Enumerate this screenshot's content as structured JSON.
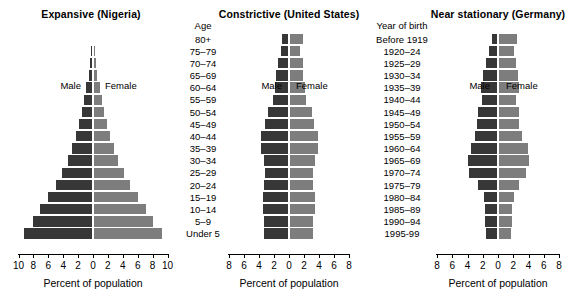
{
  "figure": {
    "axis_title": "Percent of population",
    "male_label": "Male",
    "female_label": "Female",
    "age_column_header": "Age",
    "year_column_header": "Year of birth"
  },
  "age_groups": [
    "80+",
    "75–79",
    "70–74",
    "65–69",
    "60–64",
    "55–59",
    "50–54",
    "45–49",
    "40–44",
    "35–39",
    "30–34",
    "25–29",
    "20–24",
    "15–19",
    "10–14",
    "5–9",
    "Under 5"
  ],
  "years_of_birth": [
    "Before 1919",
    "1920–24",
    "1925–29",
    "1930–34",
    "1935–39",
    "1940–44",
    "1945–49",
    "1950–54",
    "1955–59",
    "1960–64",
    "1965–69",
    "1970–74",
    "1975–79",
    "1980–84",
    "1985–89",
    "1990–94",
    "1995-99"
  ],
  "colors": {
    "male": "#373737",
    "female": "#7d7d7d",
    "background": "#ffffff",
    "axis": "#000000"
  },
  "chart_data": [
    {
      "type": "bar",
      "title": "Expansive (Nigeria)",
      "xlabel": "Percent of population",
      "ylabel": "Age",
      "xlim": [
        -10,
        10
      ],
      "xticks": [
        10,
        8,
        6,
        4,
        2,
        0,
        2,
        4,
        6,
        8,
        10
      ],
      "grid": false,
      "legend_position": "inside-plot",
      "categories": [
        "80+",
        "75–79",
        "70–74",
        "65–69",
        "60–64",
        "55–59",
        "50–54",
        "45–49",
        "40–44",
        "35–39",
        "30–34",
        "25–29",
        "20–24",
        "15–19",
        "10–14",
        "5–9",
        "Under 5"
      ],
      "series": [
        {
          "name": "Male",
          "values": [
            0.15,
            0.25,
            0.4,
            0.6,
            0.9,
            1.2,
            1.5,
            1.9,
            2.3,
            2.8,
            3.4,
            4.2,
            5.0,
            6.0,
            7.1,
            8.0,
            9.3
          ]
        },
        {
          "name": "Female",
          "values": [
            0.15,
            0.25,
            0.4,
            0.6,
            0.9,
            1.2,
            1.5,
            1.9,
            2.3,
            2.8,
            3.4,
            4.2,
            5.0,
            6.0,
            7.1,
            8.0,
            9.3
          ]
        }
      ]
    },
    {
      "type": "bar",
      "title": "Constrictive (United States)",
      "xlabel": "Percent of population",
      "ylabel": "Age",
      "xlim": [
        -8,
        8
      ],
      "xticks": [
        8,
        6,
        4,
        2,
        0,
        2,
        4,
        6,
        8
      ],
      "grid": false,
      "legend_position": "inside-plot",
      "categories": [
        "80+",
        "75–79",
        "70–74",
        "65–69",
        "60–64",
        "55–59",
        "50–54",
        "45–49",
        "40–44",
        "35–39",
        "30–34",
        "25–29",
        "20–24",
        "15–19",
        "10–14",
        "5–9",
        "Under 5"
      ],
      "series": [
        {
          "name": "Male",
          "values": [
            1.0,
            1.1,
            1.5,
            1.7,
            1.9,
            2.1,
            2.8,
            3.2,
            3.8,
            3.8,
            3.4,
            3.2,
            3.3,
            3.5,
            3.5,
            3.3,
            3.3
          ]
        },
        {
          "name": "Female",
          "values": [
            1.9,
            1.5,
            1.8,
            1.9,
            2.1,
            2.2,
            3.0,
            3.3,
            3.8,
            3.8,
            3.4,
            3.2,
            3.2,
            3.4,
            3.4,
            3.2,
            3.2
          ]
        }
      ]
    },
    {
      "type": "bar",
      "title": "Near stationary (Germany)",
      "xlabel": "Percent of population",
      "ylabel": "Year of birth",
      "xlim": [
        -8,
        8
      ],
      "xticks": [
        8,
        6,
        4,
        2,
        0,
        2,
        4,
        6,
        8
      ],
      "grid": false,
      "legend_position": "inside-plot",
      "categories": [
        "Before 1919",
        "1920–24",
        "1925–29",
        "1930–34",
        "1935–39",
        "1940–44",
        "1945–49",
        "1950–54",
        "1955–59",
        "1960–64",
        "1965–69",
        "1970–74",
        "1975–79",
        "1980–84",
        "1985–89",
        "1990–94",
        "1995-99"
      ],
      "series": [
        {
          "name": "Male",
          "values": [
            0.8,
            1.2,
            1.6,
            2.0,
            2.2,
            2.1,
            2.6,
            2.7,
            3.0,
            3.6,
            4.0,
            3.8,
            2.6,
            1.9,
            1.7,
            1.7,
            1.6
          ]
        },
        {
          "name": "Female",
          "values": [
            2.5,
            2.1,
            2.4,
            2.6,
            2.7,
            2.4,
            2.7,
            2.7,
            3.2,
            3.9,
            4.1,
            3.7,
            2.8,
            2.1,
            1.8,
            1.8,
            1.7
          ]
        }
      ]
    }
  ]
}
